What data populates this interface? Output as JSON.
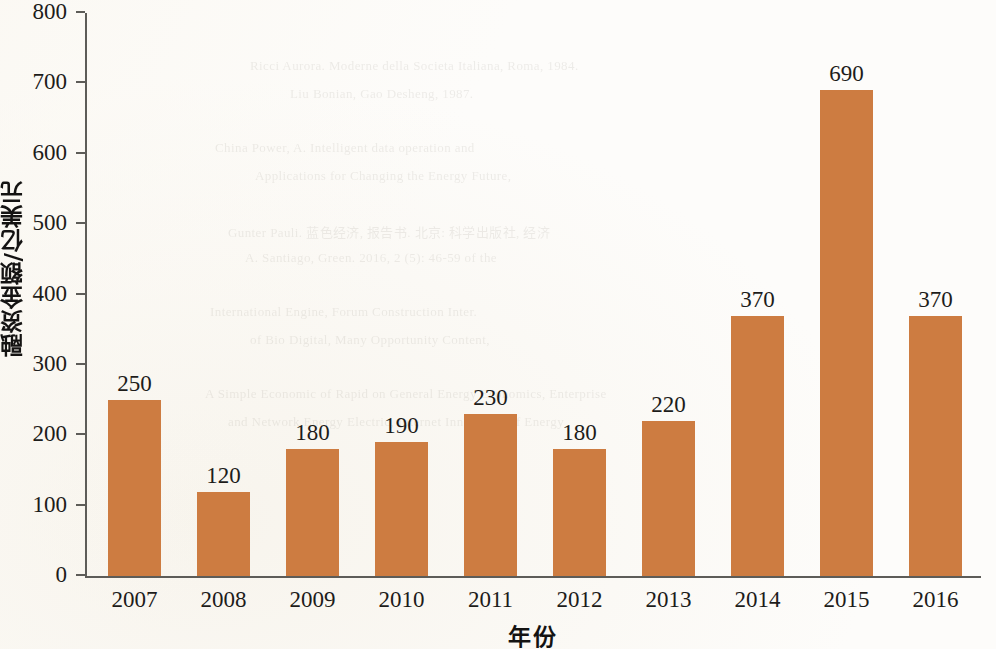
{
  "chart_data": {
    "type": "bar",
    "title": "",
    "xlabel": "年份",
    "ylabel": "融资金额/亿美元",
    "categories": [
      "2007",
      "2008",
      "2009",
      "2010",
      "2011",
      "2012",
      "2013",
      "2014",
      "2015",
      "2016"
    ],
    "values": [
      250,
      120,
      180,
      190,
      230,
      180,
      220,
      370,
      690,
      370
    ],
    "value_labels": [
      "250",
      "120",
      "180",
      "190",
      "230",
      "180",
      "220",
      "370",
      "690",
      "370"
    ],
    "ylim": [
      0,
      800
    ],
    "yticks": [
      0,
      100,
      200,
      300,
      400,
      500,
      600,
      700,
      800
    ],
    "ytick_labels": [
      "0",
      "100",
      "200",
      "300",
      "400",
      "500",
      "600",
      "700",
      "800"
    ],
    "grid": false,
    "legend": null,
    "bar_color": "#cd7c41",
    "axis_color": "#5d5c58",
    "text_color": "#1d1c1a",
    "background_color": "#fdfcfa"
  },
  "ghost_text": {
    "lines": [
      "Ricci Aurora. Moderne della Societa Italiana, Roma, 1984.",
      "Liu Bonian, Gao Desheng, 1987.",
      "China Power, A. Intelligent data operation and",
      "Applications for Changing the Energy Future,",
      "Gunter Pauli. 蓝色经济, 报告书. 北京: 科学出版社, 经济",
      "A. Santiago, Green. 2016, 2 (5): 46-59 of the",
      "International Engine, Forum Construction Inter.",
      "of Bio Digital, Many Opportunity Content,",
      "A Simple Economic of Rapid on General Energy Economics, Enterprise",
      "and Network Energy Electric, Internet Innovation of Energy"
    ]
  }
}
